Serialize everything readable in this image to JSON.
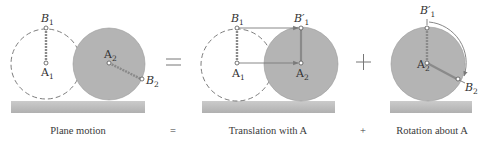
{
  "colors": {
    "disk_fill": "#b4b4b4",
    "disk_stroke": "#8c8c8c",
    "dashed_outline": "#6e6e6e",
    "ground_top": "#c8c8c8",
    "ground_bottom": "#b2b2b2",
    "segment": "#8a8a8a",
    "arrow": "#7a7a7a",
    "text": "#333333",
    "background": "#ffffff"
  },
  "operators": {
    "equals": "=",
    "plus": "+"
  },
  "panels": [
    {
      "id": "plane-motion",
      "caption": "Plane motion",
      "points": {
        "B1": {
          "base": "B",
          "sub": "1"
        },
        "A1": {
          "base": "A",
          "sub": "1"
        },
        "A2": {
          "base": "A",
          "sub": "2"
        },
        "B2": {
          "base": "B",
          "sub": "2"
        }
      }
    },
    {
      "id": "translation",
      "caption": "Translation with A",
      "points": {
        "B1": {
          "base": "B",
          "sub": "1"
        },
        "B1p": {
          "base": "B′",
          "sub": "1"
        },
        "A1": {
          "base": "A",
          "sub": "1"
        },
        "A2": {
          "base": "A",
          "sub": "2"
        }
      }
    },
    {
      "id": "rotation",
      "caption": "Rotation about A",
      "points": {
        "B1p": {
          "base": "B′",
          "sub": "1"
        },
        "A2": {
          "base": "A",
          "sub": "2"
        },
        "B2": {
          "base": "B",
          "sub": "2"
        }
      }
    }
  ],
  "captions": {
    "equals": "=",
    "plus": "+"
  }
}
